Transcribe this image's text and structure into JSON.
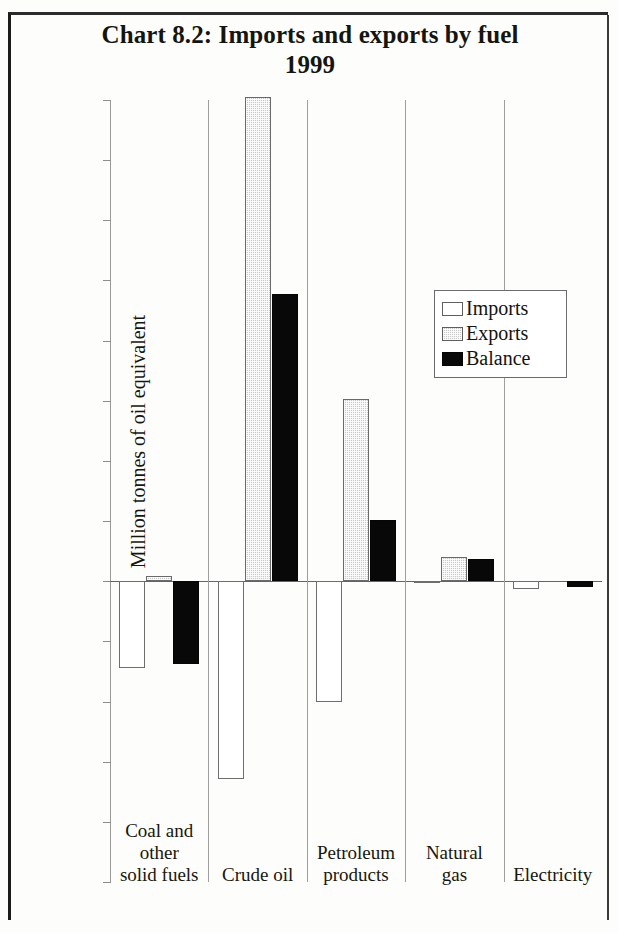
{
  "chart_data": {
    "type": "bar",
    "title": "Chart 8.2: Imports and exports by fuel",
    "subtitle": "1999",
    "xlabel": "",
    "ylabel": "Million tonnes of oil equivalent",
    "ylim": [
      -50,
      80
    ],
    "ytick_step": 10,
    "grid": false,
    "legend_position": "inside-upper-right",
    "categories": [
      "Coal and other solid fuels",
      "Crude oil",
      "Petroleum products",
      "Natural gas",
      "Electricity"
    ],
    "category_lines": [
      [
        "Coal and",
        "other",
        "solid fuels"
      ],
      [
        "Crude oil"
      ],
      [
        "Petroleum",
        "products"
      ],
      [
        "Natural",
        "gas"
      ],
      [
        "Electricity"
      ]
    ],
    "series": [
      {
        "name": "Imports",
        "color": "#ffffff",
        "values": [
          -14.5,
          -32.8,
          -20.1,
          -0.3,
          -1.3
        ]
      },
      {
        "name": "Exports",
        "color": "#c9c9c9",
        "values": [
          0.8,
          80.5,
          30.3,
          4.0,
          0.0
        ]
      },
      {
        "name": "Balance",
        "color": "#080808",
        "values": [
          -13.7,
          47.7,
          10.2,
          3.7,
          -1.0
        ]
      }
    ],
    "yticks": [
      {
        "value": 80,
        "label": "80"
      },
      {
        "value": 70,
        "label": "70"
      },
      {
        "value": 60,
        "label": "60"
      },
      {
        "value": 50,
        "label": "50"
      },
      {
        "value": 40,
        "label": "40"
      },
      {
        "value": 30,
        "label": "30"
      },
      {
        "value": 20,
        "label": "20"
      },
      {
        "value": 10,
        "label": "10"
      },
      {
        "value": 0,
        "label": "0"
      },
      {
        "value": -10,
        "label": "-10"
      },
      {
        "value": -20,
        "label": "-20"
      },
      {
        "value": -30,
        "label": "-30"
      },
      {
        "value": -40,
        "label": "-40"
      },
      {
        "value": -50,
        "label": "-50"
      }
    ]
  },
  "legend": {
    "items": [
      {
        "label": "Imports",
        "key": "imports"
      },
      {
        "label": "Exports",
        "key": "exports"
      },
      {
        "label": "Balance",
        "key": "balance"
      }
    ]
  }
}
